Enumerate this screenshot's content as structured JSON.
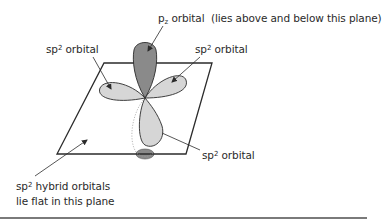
{
  "diagram": {
    "labels": {
      "pz": {
        "main": "p",
        "subscript": "z",
        "rest": " orbital  (lies above and below this plane)"
      },
      "sp2_left": {
        "base": "sp",
        "sup": "2",
        "rest": " orbital"
      },
      "sp2_right": {
        "base": "sp",
        "sup": "2",
        "rest": " orbital"
      },
      "sp2_bottom": {
        "base": "sp",
        "sup": "2",
        "rest": " orbital"
      },
      "plane_note": {
        "line1_base": "sp",
        "line1_sup": "2",
        "line1_rest": " hybrid orbitals",
        "line2": "lie flat in this plane"
      }
    },
    "colors": {
      "pz_lobe": "#8a8a8a",
      "sp2_lobe": "#d6d6d6",
      "outline": "#2b2b2b",
      "text": "#2a2a2a",
      "divider": "#7a7a7a"
    }
  }
}
